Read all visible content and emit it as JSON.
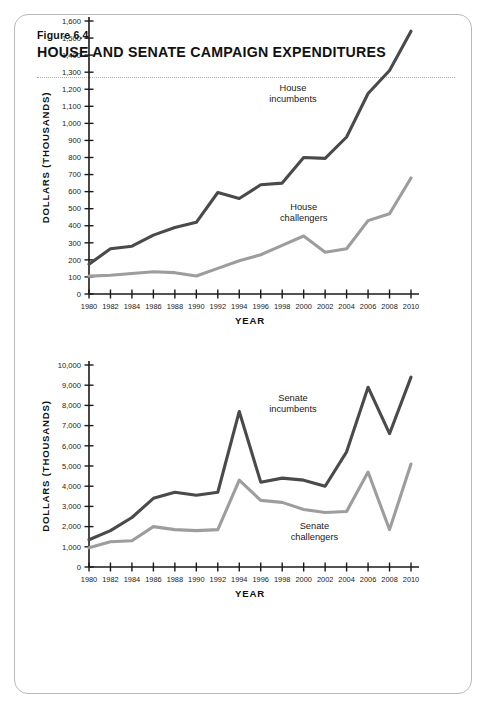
{
  "figure": {
    "number_label": "Figure 6.4",
    "title": "HOUSE AND SENATE CAMPAIGN EXPENDITURES"
  },
  "chart_data": [
    {
      "type": "line",
      "id": "house",
      "title": "",
      "xlabel": "YEAR",
      "ylabel": "DOLLARS (THOUSANDS)",
      "x": [
        1980,
        1982,
        1984,
        1986,
        1988,
        1990,
        1992,
        1994,
        1996,
        1998,
        2000,
        2002,
        2004,
        2006,
        2008,
        2010
      ],
      "xtick_labels": [
        "1980",
        "1982",
        "1984",
        "1986",
        "1988",
        "1990",
        "1992",
        "1994",
        "1996",
        "1998",
        "2000",
        "2002",
        "2004",
        "2006",
        "2008",
        "2010"
      ],
      "xlim": [
        1980,
        2010
      ],
      "ylim": [
        0,
        1600
      ],
      "ytick_labels": [
        "0",
        "100",
        "200",
        "300",
        "400",
        "500",
        "600",
        "700",
        "800",
        "900",
        "1,000",
        "1,100",
        "1,200",
        "1,300",
        "1,400",
        "1,500",
        "1,600"
      ],
      "ytick_values": [
        0,
        100,
        200,
        300,
        400,
        500,
        600,
        700,
        800,
        900,
        1000,
        1100,
        1200,
        1300,
        1400,
        1500,
        1600
      ],
      "grid": false,
      "legend_position": "inline-annotation",
      "series": [
        {
          "name": "House incumbents",
          "color": "#4a4a4a",
          "label_x": 1999,
          "label_y": 1190,
          "values": [
            175,
            265,
            280,
            345,
            390,
            420,
            595,
            560,
            640,
            650,
            800,
            795,
            920,
            1175,
            1310,
            1540
          ]
        },
        {
          "name": "House challengers",
          "color": "#9d9d9d",
          "label_x": 2000,
          "label_y": 490,
          "values": [
            105,
            110,
            120,
            130,
            125,
            105,
            150,
            195,
            230,
            285,
            340,
            245,
            265,
            430,
            470,
            680
          ]
        }
      ]
    },
    {
      "type": "line",
      "id": "senate",
      "title": "",
      "xlabel": "YEAR",
      "ylabel": "DOLLARS (THOUSANDS)",
      "x": [
        1980,
        1982,
        1984,
        1986,
        1988,
        1990,
        1992,
        1994,
        1996,
        1998,
        2000,
        2002,
        2004,
        2006,
        2008,
        2010
      ],
      "xtick_labels": [
        "1980",
        "1982",
        "1984",
        "1986",
        "1988",
        "1990",
        "1992",
        "1994",
        "1996",
        "1998",
        "2000",
        "2002",
        "2004",
        "2006",
        "2008",
        "2010"
      ],
      "xlim": [
        1980,
        2010
      ],
      "ylim": [
        0,
        10000
      ],
      "ytick_labels": [
        "0",
        "1,000",
        "2,000",
        "3,000",
        "4,000",
        "5,000",
        "6,000",
        "7,000",
        "8,000",
        "9,000",
        "10,000"
      ],
      "ytick_values": [
        0,
        1000,
        2000,
        3000,
        4000,
        5000,
        6000,
        7000,
        8000,
        9000,
        10000
      ],
      "grid": false,
      "legend_position": "inline-annotation",
      "series": [
        {
          "name": "Senate incumbents",
          "color": "#4a4a4a",
          "label_x": 1999,
          "label_y": 8200,
          "values": [
            1350,
            1800,
            2450,
            3400,
            3700,
            3550,
            3700,
            7700,
            4200,
            4400,
            4300,
            4000,
            5700,
            8900,
            6600,
            9400
          ]
        },
        {
          "name": "Senate challengers",
          "color": "#9d9d9d",
          "label_x": 2001,
          "label_y": 1900,
          "values": [
            950,
            1250,
            1300,
            2000,
            1850,
            1800,
            1850,
            4300,
            3300,
            3200,
            2850,
            2700,
            2750,
            4700,
            1850,
            5100
          ]
        }
      ]
    }
  ]
}
